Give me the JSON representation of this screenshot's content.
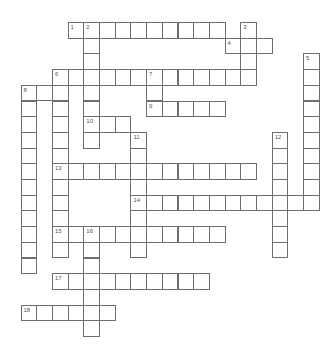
{
  "puzzle": {
    "type": "crossword",
    "grid": {
      "origin_x": 20.5,
      "origin_y": 22,
      "cell_size": 15.7
    },
    "colors": {
      "cell_border": "#6e6e6e",
      "cell_fill": "#ffffff",
      "number": "#555555"
    },
    "entries": [
      {
        "number": 1,
        "direction": "across",
        "col": 3,
        "row": 0,
        "length": 10
      },
      {
        "number": 2,
        "direction": "down",
        "col": 4,
        "row": 0,
        "length": 8
      },
      {
        "number": 3,
        "direction": "down",
        "col": 14,
        "row": 0,
        "length": 4
      },
      {
        "number": 4,
        "direction": "across",
        "col": 13,
        "row": 1,
        "length": 3
      },
      {
        "number": 5,
        "direction": "down",
        "col": 18,
        "row": 2,
        "length": 10
      },
      {
        "number": 6,
        "direction": "across",
        "col": 2,
        "row": 3,
        "length": 13
      },
      {
        "number": 6,
        "direction": "down",
        "col": 2,
        "row": 3,
        "length": 12
      },
      {
        "number": 7,
        "direction": "down",
        "col": 8,
        "row": 3,
        "length": 3
      },
      {
        "number": 8,
        "direction": "down",
        "col": 0,
        "row": 4,
        "length": 12
      },
      {
        "number": 8,
        "direction": "across",
        "col": 0,
        "row": 4,
        "length": 3
      },
      {
        "number": 9,
        "direction": "across",
        "col": 8,
        "row": 5,
        "length": 5
      },
      {
        "number": 10,
        "direction": "across",
        "col": 4,
        "row": 6,
        "length": 3
      },
      {
        "number": 11,
        "direction": "down",
        "col": 7,
        "row": 7,
        "length": 8
      },
      {
        "number": 12,
        "direction": "down",
        "col": 16,
        "row": 7,
        "length": 8
      },
      {
        "number": 13,
        "direction": "across",
        "col": 2,
        "row": 9,
        "length": 13
      },
      {
        "number": 14,
        "direction": "across",
        "col": 7,
        "row": 11,
        "length": 12
      },
      {
        "number": 15,
        "direction": "across",
        "col": 2,
        "row": 13,
        "length": 11
      },
      {
        "number": 16,
        "direction": "down",
        "col": 4,
        "row": 13,
        "length": 7
      },
      {
        "number": 17,
        "direction": "across",
        "col": 2,
        "row": 16,
        "length": 10
      },
      {
        "number": 18,
        "direction": "across",
        "col": 0,
        "row": 18,
        "length": 6
      }
    ]
  }
}
